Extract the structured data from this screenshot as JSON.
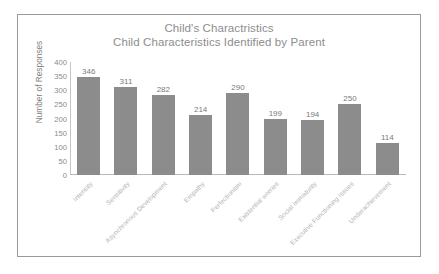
{
  "chart_data": {
    "type": "bar",
    "title": "Child's Charactristics",
    "subtitle": "Child Characteristics Identified by Parent",
    "xlabel": "",
    "ylabel": "Number of Responses",
    "ylim": [
      0,
      400
    ],
    "yticks": [
      400,
      350,
      300,
      250,
      200,
      150,
      100,
      50,
      0
    ],
    "grid": false,
    "legend": false,
    "legend_position": "none",
    "data_labels": true,
    "bar_color": "#8c8c8c",
    "categories": [
      "Intensity",
      "Sensitivity",
      "Asynchronous Development",
      "Empathy",
      "Perfectionism",
      "Existential worries",
      "Social Immaturity",
      "Executive Functioning Issues",
      "Underachievement"
    ],
    "values": [
      346,
      311,
      282,
      214,
      290,
      199,
      194,
      250,
      114
    ]
  },
  "frame": {
    "border_color": "#9a9a9a",
    "background": "#ffffff"
  }
}
